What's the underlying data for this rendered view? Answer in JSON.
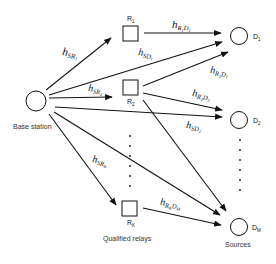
{
  "diagram": {
    "nodes": {
      "base_station": {
        "label": "Base station"
      },
      "relays": [
        {
          "id": "R1",
          "label": "R",
          "sub": "1"
        },
        {
          "id": "R2",
          "label": "R",
          "sub": "2"
        },
        {
          "id": "RK",
          "label": "R",
          "sub": "K"
        }
      ],
      "sources": [
        {
          "id": "D1",
          "label": "D",
          "sub": "1"
        },
        {
          "id": "D2",
          "label": "D",
          "sub": "2"
        },
        {
          "id": "DM",
          "label": "D",
          "sub": "M"
        }
      ]
    },
    "group_labels": {
      "relays": "Qualified relays",
      "sources": "Sources"
    },
    "edges": [
      {
        "from": "BS",
        "to": "R1",
        "h": "h",
        "sub": "SR",
        "subsub": "1"
      },
      {
        "from": "BS",
        "to": "R2",
        "h": "h",
        "sub": "SR",
        "subsub": "2"
      },
      {
        "from": "BS",
        "to": "RK",
        "h": "h",
        "sub": "SR",
        "subsub": "K"
      },
      {
        "from": "BS",
        "to": "D1",
        "h": "h",
        "sub": "SD",
        "subsub": "1"
      },
      {
        "from": "BS",
        "to": "D2",
        "h": "h",
        "sub": "SD",
        "subsub": "2"
      },
      {
        "from": "BS",
        "to": "DM",
        "h": "",
        "sub": "",
        "subsub": ""
      },
      {
        "from": "R1",
        "to": "D1",
        "h": "h",
        "sub": "R",
        "subsub": "1",
        "sub2": "D",
        "subsub2": "1"
      },
      {
        "from": "R2",
        "to": "D1",
        "h": "h",
        "sub": "R",
        "subsub": "2",
        "sub2": "D",
        "subsub2": "1"
      },
      {
        "from": "R2",
        "to": "D2",
        "h": "h",
        "sub": "R",
        "subsub": "2",
        "sub2": "D",
        "subsub2": "2"
      },
      {
        "from": "R2",
        "to": "DM",
        "h": "",
        "sub": "",
        "subsub": ""
      },
      {
        "from": "RK",
        "to": "DM",
        "h": "h",
        "sub": "R",
        "subsub": "K",
        "sub2": "D",
        "subsub2": "M"
      }
    ]
  }
}
